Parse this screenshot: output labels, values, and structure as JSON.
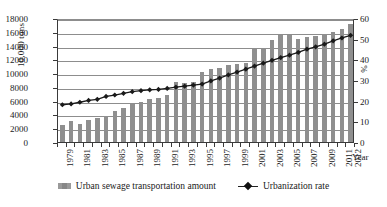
{
  "chart_data": {
    "type": "bar",
    "title": "",
    "subtitle": "",
    "xlabel": "Year",
    "ylabel": "10,000 tons",
    "ylabel_secondary": "%",
    "grid": true,
    "legend_position": "bottom",
    "ylim": [
      0,
      18000
    ],
    "ylim_secondary": [
      0,
      60
    ],
    "yticks": [
      0,
      2000,
      4000,
      6000,
      8000,
      10000,
      12000,
      14000,
      16000,
      18000
    ],
    "ytick_labels": [
      "0",
      "2000",
      "4000",
      "6000",
      "8000",
      "10000",
      "12000",
      "14000",
      "16000",
      "18000"
    ],
    "yticks_secondary": [
      0,
      10,
      20,
      30,
      40,
      50,
      60
    ],
    "ytick_labels_secondary": [
      "0",
      "10",
      "20",
      "30",
      "40",
      "50",
      "60"
    ],
    "categories": [
      "1979",
      "1980",
      "1981",
      "1982",
      "1983",
      "1984",
      "1985",
      "1986",
      "1987",
      "1988",
      "1989",
      "1990",
      "1991",
      "1992",
      "1993",
      "1994",
      "1995",
      "1996",
      "1997",
      "1998",
      "1999",
      "2000",
      "2001",
      "2002",
      "2003",
      "2004",
      "2005",
      "2006",
      "2007",
      "2008",
      "2009",
      "2010",
      "2011",
      "2012"
    ],
    "xtick_labels_shown": [
      "1979",
      "1981",
      "1983",
      "1985",
      "1987",
      "1989",
      "1991",
      "1993",
      "1995",
      "1997",
      "1999",
      "2001",
      "2003",
      "2005",
      "2007",
      "2009",
      "2011",
      "2012"
    ],
    "series": [
      {
        "name": "Urban sewage transportation amount",
        "type": "bar",
        "axis": "left",
        "unit": "10,000 tons",
        "color": "#8f8f8f",
        "values": [
          2400,
          3100,
          2600,
          3150,
          3450,
          3800,
          4450,
          4900,
          5450,
          5800,
          6300,
          6350,
          6850,
          8650,
          8600,
          8650,
          10100,
          10650,
          10800,
          11150,
          11350,
          11500,
          13450,
          13600,
          14800,
          15500,
          15600,
          14900,
          15250,
          15350,
          15700,
          15900,
          16400,
          17100
        ]
      },
      {
        "name": "Urbanization rate",
        "type": "line",
        "axis": "right",
        "unit": "%",
        "color": "#1a1a1a",
        "marker": "diamond",
        "values": [
          19.0,
          19.4,
          20.2,
          21.1,
          21.6,
          23.0,
          23.7,
          24.5,
          25.3,
          25.8,
          26.2,
          26.4,
          26.9,
          27.5,
          28.0,
          28.5,
          29.0,
          30.5,
          31.9,
          33.4,
          34.8,
          36.2,
          37.7,
          39.1,
          40.5,
          41.8,
          43.0,
          44.3,
          45.9,
          47.0,
          48.3,
          49.9,
          51.3,
          52.6
        ]
      }
    ]
  },
  "legend": {
    "entries": [
      {
        "label": "Urban sewage transportation amount",
        "marker": "bar-swatch"
      },
      {
        "label": "Urbanization rate",
        "marker": "line-diamond-swatch"
      }
    ]
  },
  "axes": {
    "left_title": "10,000 tons",
    "right_title": "%",
    "bottom_title": "Year"
  }
}
